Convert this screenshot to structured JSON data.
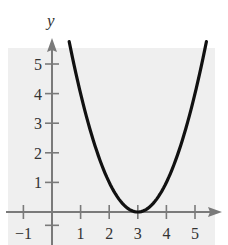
{
  "chart_data": {
    "type": "line",
    "title": "",
    "xlabel": "",
    "ylabel": "y",
    "function": "y = (x - 3)^2",
    "xlim": [
      -1.5,
      5.7
    ],
    "ylim": [
      -0.6,
      5.5
    ],
    "x_ticks": [
      -1,
      1,
      2,
      3,
      4,
      5
    ],
    "y_ticks": [
      1,
      2,
      3,
      4,
      5
    ],
    "x_tick_labels": [
      "−1",
      "1",
      "2",
      "3",
      "4",
      "5"
    ],
    "y_tick_labels": [
      "1",
      "2",
      "3",
      "4",
      "5"
    ],
    "grid": false,
    "legend": null,
    "series": [
      {
        "name": "parabola",
        "x": [
          0.6,
          1,
          1.5,
          2,
          2.5,
          3,
          3.5,
          4,
          4.5,
          5,
          5.4
        ],
        "y": [
          5.76,
          4,
          2.25,
          1,
          0.25,
          0,
          0.25,
          1,
          2.25,
          4,
          5.76
        ]
      }
    ],
    "vertex": [
      3,
      0
    ],
    "colors": {
      "background_panel": "#efefef",
      "axis": "#7a7a7a",
      "curve": "#111111",
      "text": "#333333"
    }
  }
}
